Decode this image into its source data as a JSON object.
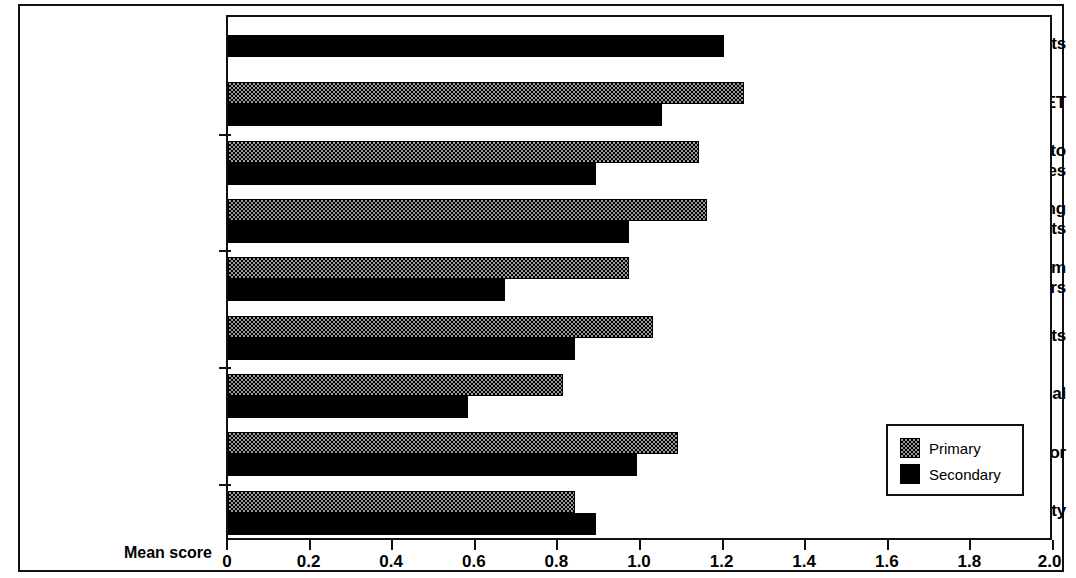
{
  "chart_data": {
    "type": "bar",
    "orientation": "horizontal",
    "title": "",
    "subtitle": "",
    "xlabel": "Mean score",
    "ylabel": "",
    "xlim": [
      0,
      2.0
    ],
    "xticks": [
      "0",
      "0.2",
      "0.4",
      "0.6",
      "0.8",
      "1.0",
      "1.2",
      "1.4",
      "1.6",
      "1.8",
      "2.0"
    ],
    "xtick_values": [
      0,
      0.2,
      0.4,
      0.6,
      0.8,
      1.0,
      1.2,
      1.4,
      1.6,
      1.8,
      2.0
    ],
    "grid": false,
    "legend_position": "bottom-right",
    "categories": [
      "Dept. projects",
      "Whole school INSET",
      "Key teachers to outside courses",
      "Agreeing & monitoring targets",
      "Support from LEA advisers",
      "Outside consultants",
      "Staff appraisal",
      "Coordinator",
      "Working party"
    ],
    "category_label_lines": [
      [
        "Dept. projects"
      ],
      [
        "Whole school INSET"
      ],
      [
        "Key teachers to",
        "outside courses"
      ],
      [
        "Agreeing & monitoring",
        "targets"
      ],
      [
        "Support from",
        "LEA advisers"
      ],
      [
        "Outside consultants"
      ],
      [
        "Staff appraisal"
      ],
      [
        "Coordinator"
      ],
      [
        "Working party"
      ]
    ],
    "series": [
      {
        "name": "Primary",
        "color": "#9a9a9a",
        "pattern": "checkerboard",
        "values": [
          null,
          1.25,
          1.14,
          1.16,
          0.97,
          1.03,
          0.81,
          1.09,
          0.84
        ]
      },
      {
        "name": "Secondary",
        "color": "#000000",
        "pattern": "solid",
        "values": [
          1.2,
          1.05,
          0.89,
          0.97,
          0.67,
          0.84,
          0.58,
          0.99,
          0.89
        ]
      }
    ]
  },
  "legend": {
    "entries": [
      {
        "label": "Primary",
        "swatch": "primary"
      },
      {
        "label": "Secondary",
        "swatch": "secondary"
      }
    ]
  },
  "axis": {
    "x_title": "Mean score"
  }
}
